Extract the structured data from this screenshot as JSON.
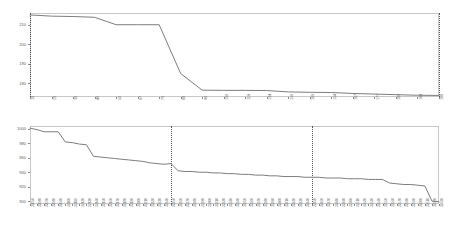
{
  "figure": {
    "title": "",
    "background": "#ffffff",
    "line_color": "#7d7d7d",
    "axis_color": "#c8c8c8",
    "tick_label_color": "#707070"
  },
  "chart_data": [
    {
      "type": "line",
      "panel": "top",
      "title": "",
      "xlabel": "",
      "ylabel": "",
      "ylim": [
        173,
        216
      ],
      "yticks": [
        180,
        190,
        200,
        210
      ],
      "ytick_labels": [
        "180",
        "190",
        "200",
        "210"
      ],
      "grid": false,
      "legend": null,
      "annotations": [
        {
          "type": "vline",
          "x_index": 0,
          "style": "dotted"
        },
        {
          "type": "vline",
          "x_index": 19,
          "style": "dotted"
        }
      ],
      "categories": [
        "10",
        "20",
        "30",
        "40",
        "50",
        "67",
        "70",
        "88",
        "98",
        "100",
        "114",
        "134",
        "150",
        "160",
        "154",
        "167",
        "177",
        "180",
        "184",
        "188"
      ],
      "values": [
        215.0,
        214.4,
        214.2,
        213.8,
        210.0,
        210.0,
        210.0,
        185.0,
        176.5,
        176.4,
        176.4,
        176.3,
        175.6,
        175.4,
        175.3,
        174.8,
        174.5,
        174.2,
        173.9,
        173.8
      ]
    },
    {
      "type": "line",
      "panel": "bottom",
      "title": "",
      "xlabel": "",
      "ylabel": "",
      "ylim": [
        896,
        1004
      ],
      "yticks": [
        900,
        920,
        940,
        960,
        980,
        1000
      ],
      "ytick_labels": [
        "900",
        "920",
        "940",
        "960",
        "980",
        "1000"
      ],
      "grid": false,
      "legend": null,
      "annotations": [
        {
          "type": "vline",
          "x_index": 20,
          "style": "dotted"
        },
        {
          "type": "vline",
          "x_index": 40,
          "style": "dotted"
        }
      ],
      "categories": [
        "32050",
        "32080",
        "32070",
        "32080",
        "32040",
        "32100",
        "32110",
        "32120",
        "32130",
        "32140",
        "32150",
        "32160",
        "32170",
        "32180",
        "32190",
        "32200",
        "32210",
        "32220",
        "32230",
        "32240",
        "32250",
        "32260",
        "32270",
        "32280",
        "32290",
        "32300",
        "32310",
        "32320",
        "32330",
        "32340",
        "32350",
        "32360",
        "32370",
        "32380",
        "32390",
        "32400",
        "32410",
        "32420",
        "32430",
        "32440",
        "32450",
        "32460",
        "32470",
        "32480",
        "32490",
        "32500",
        "32510",
        "32520",
        "32530",
        "32540",
        "32550",
        "32560",
        "32570",
        "32580",
        "32590",
        "32600",
        "32610",
        "32620",
        "32630"
      ],
      "values": [
        1001,
        999,
        996,
        996,
        996,
        982,
        981,
        979,
        978,
        962,
        961,
        960,
        959,
        958,
        957,
        956,
        955,
        953,
        952,
        951,
        952,
        942,
        941,
        941,
        940,
        940,
        939,
        939,
        938,
        938,
        937,
        937,
        936,
        936,
        935,
        935,
        934,
        934,
        934,
        933,
        933,
        933,
        932,
        932,
        932,
        931,
        931,
        931,
        930,
        930,
        930,
        925,
        924,
        923,
        923,
        922,
        921,
        900,
        899
      ]
    }
  ]
}
